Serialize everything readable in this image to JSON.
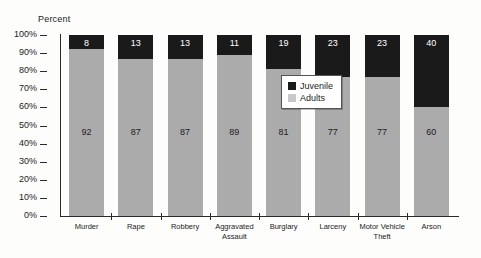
{
  "chart_data": {
    "type": "bar",
    "subtype": "stacked-100-percent",
    "title": "",
    "xlabel": "",
    "ylabel": "Percent",
    "ylim": [
      0,
      100
    ],
    "ytick_labels": [
      "100%",
      "90%",
      "80%",
      "70%",
      "60%",
      "50%",
      "40%",
      "30%",
      "20%",
      "10%",
      "0%"
    ],
    "ytick_values": [
      100,
      90,
      80,
      70,
      60,
      50,
      40,
      30,
      20,
      10,
      0
    ],
    "grid": false,
    "legend_position": "inside-center-right",
    "categories": [
      "Murder",
      "Rape",
      "Robbery",
      "Aggravated\nAssault",
      "Burglary",
      "Larceny",
      "Motor Vehicle\nTheft",
      "Arson"
    ],
    "series": [
      {
        "name": "Juvenile",
        "color": "#1a1a1a",
        "values": [
          8,
          13,
          13,
          11,
          19,
          23,
          23,
          40
        ]
      },
      {
        "name": "Adults",
        "color": "#ababab",
        "values": [
          92,
          87,
          87,
          89,
          81,
          77,
          77,
          60
        ]
      }
    ]
  },
  "legend": {
    "items": [
      {
        "label": "Juvenile",
        "swatch": "juvenile"
      },
      {
        "label": "Adults",
        "swatch": "adults"
      }
    ]
  }
}
